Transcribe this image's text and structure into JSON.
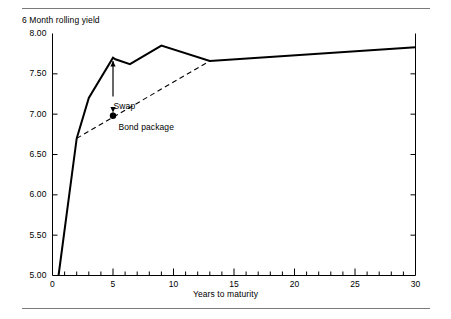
{
  "figure": {
    "has_top_rule": true,
    "has_bottom_rule": true,
    "background_color": "#ffffff",
    "line_color": "#000000",
    "rule_color": "#7a7a7a"
  },
  "chart_data": {
    "type": "line",
    "title": "6 Month rolling yield",
    "subtitle": "",
    "xlabel": "Years to maturity",
    "ylabel": "6 Month rolling yield",
    "xlim": [
      0,
      30
    ],
    "ylim": [
      5.0,
      8.0
    ],
    "grid": false,
    "legend_position": "none",
    "x_ticks_major": [
      0,
      5,
      10,
      15,
      20,
      25,
      30
    ],
    "x_tick_labels": [
      "0",
      "5",
      "10",
      "15",
      "20",
      "25",
      "30"
    ],
    "x_tick_minor_step": 1,
    "y_ticks_major": [
      5.0,
      5.5,
      6.0,
      6.5,
      7.0,
      7.5,
      8.0
    ],
    "y_tick_labels": [
      "5.00",
      "5.50",
      "6.00",
      "6.50",
      "7.00",
      "7.50",
      "8.00"
    ],
    "series": [
      {
        "name": "Yield curve",
        "style": "solid",
        "x": [
          0.5,
          2.0,
          3.0,
          5.0,
          5.2,
          6.4,
          9.0,
          13.0,
          30.0
        ],
        "y": [
          5.0,
          6.7,
          7.2,
          7.7,
          7.68,
          7.62,
          7.85,
          7.66,
          7.83
        ]
      },
      {
        "name": "Bond package line",
        "style": "dashed",
        "x": [
          2.0,
          13.0
        ],
        "y": [
          6.7,
          7.66
        ]
      }
    ],
    "annotations": [
      {
        "name": "swap",
        "label": "Swap",
        "label_x": 5.05,
        "label_y": 7.1,
        "arrow_from_x": 5.0,
        "arrow_from_y": 7.22,
        "arrow_to_x": 5.0,
        "arrow_to_y": 7.66,
        "arrow_head": "up"
      },
      {
        "name": "bond-package",
        "label": "Bond package",
        "label_x": 5.45,
        "label_y": 6.83,
        "arrow_from_x": 5.0,
        "arrow_from_y": 6.98,
        "arrow_to_x": 5.0,
        "arrow_to_y": 7.02,
        "arrow_head": "down",
        "marker": "filled-circle",
        "marker_x": 5.0,
        "marker_y": 6.98
      }
    ]
  }
}
